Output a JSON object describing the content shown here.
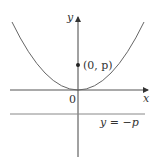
{
  "diagram": {
    "type": "parabola-focus-directrix",
    "axes": {
      "x_label": "x",
      "y_label": "y",
      "origin_label": "0"
    },
    "curve": {
      "equation": "x^2 = 4py",
      "color": "#555555"
    },
    "focus": {
      "label": "(0, p)"
    },
    "directrix": {
      "label": "y = −p"
    },
    "colors": {
      "axis": "#444444",
      "curve": "#666666",
      "directrix": "#777777",
      "text": "#333333"
    }
  }
}
